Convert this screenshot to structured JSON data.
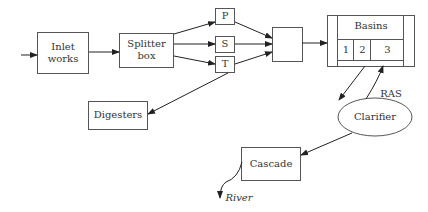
{
  "diagram": {
    "type": "process-flow",
    "colors": {
      "stroke": "#555555",
      "text": "#333333",
      "background": "#ffffff"
    },
    "nodes": {
      "inlet": {
        "label_line1": "Inlet",
        "label_line2": "works"
      },
      "splitter": {
        "label_line1": "Splitter",
        "label_line2": "box"
      },
      "p": {
        "label": "P"
      },
      "s": {
        "label": "S"
      },
      "t": {
        "label": "T"
      },
      "mixer": {
        "label": ""
      },
      "basins": {
        "label": "Basins",
        "cells": [
          "1",
          "2",
          "3"
        ]
      },
      "digesters": {
        "label": "Digesters"
      },
      "clarifier": {
        "label": "Clarifier"
      },
      "cascade": {
        "label": "Cascade"
      }
    },
    "edge_labels": {
      "ras": "RAS",
      "river": "River"
    },
    "edges": [
      {
        "from": "input",
        "to": "inlet"
      },
      {
        "from": "inlet",
        "to": "splitter"
      },
      {
        "from": "splitter",
        "to": "p"
      },
      {
        "from": "splitter",
        "to": "s"
      },
      {
        "from": "splitter",
        "to": "t"
      },
      {
        "from": "p",
        "to": "mixer"
      },
      {
        "from": "s",
        "to": "mixer"
      },
      {
        "from": "t",
        "to": "mixer"
      },
      {
        "from": "t",
        "to": "digesters"
      },
      {
        "from": "mixer",
        "to": "basins"
      },
      {
        "from": "basins",
        "to": "clarifier"
      },
      {
        "from": "clarifier",
        "to": "basins",
        "label": "RAS"
      },
      {
        "from": "clarifier",
        "to": "cascade"
      },
      {
        "from": "cascade",
        "to": "river"
      }
    ]
  }
}
